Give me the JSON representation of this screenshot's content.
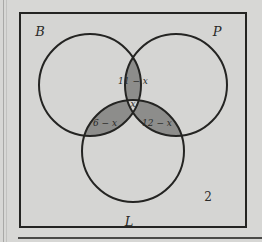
{
  "figure": {
    "type": "venn-diagram-3-set",
    "universal_set_label": "",
    "colors": {
      "page_background": "#d7d7d5",
      "universe_fill": "#d5d5d3",
      "circle_fill": "#d5d5d3",
      "shaded_fill": "#8d8d8b",
      "stroke": "#242422",
      "text": "#2a2a28"
    },
    "universe_rect": {
      "x": 20,
      "y": 13,
      "width": 226,
      "height": 214,
      "stroke_width": 2
    },
    "sets": [
      {
        "id": "B",
        "label": "B",
        "label_x": 40,
        "label_y": 36,
        "cx": 90,
        "cy": 85,
        "r": 51
      },
      {
        "id": "P",
        "label": "P",
        "label_x": 217,
        "label_y": 36,
        "cx": 176,
        "cy": 85,
        "r": 51
      },
      {
        "id": "L",
        "label": "L",
        "label_x": 129,
        "label_y": 226,
        "cx": 133,
        "cy": 151,
        "r": 51
      }
    ],
    "regions": [
      {
        "id": "B-and-P-only",
        "label": "11 − x",
        "shaded": true,
        "label_x": 133,
        "label_y": 84
      },
      {
        "id": "B-and-L-only",
        "label": "6 − x",
        "shaded": true,
        "label_x": 105,
        "label_y": 126
      },
      {
        "id": "P-and-L-only",
        "label": "12 − x",
        "shaded": true,
        "label_x": 157,
        "label_y": 126
      },
      {
        "id": "B-and-P-and-L",
        "label": "x",
        "shaded": false,
        "label_x": 133,
        "label_y": 107
      },
      {
        "id": "outside-all-sets",
        "label": "2",
        "shaded": false,
        "label_x": 208,
        "label_y": 201
      }
    ]
  }
}
